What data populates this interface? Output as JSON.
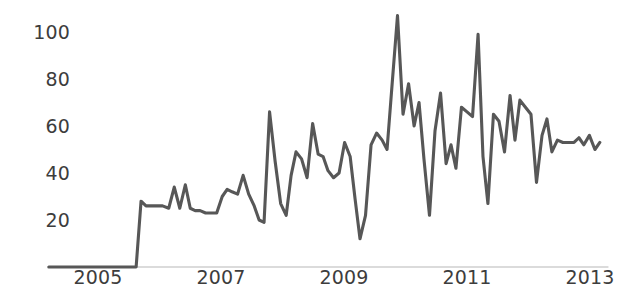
{
  "chart_data": {
    "type": "line",
    "title": "",
    "subtitle": "",
    "xlabel": "",
    "ylabel": "",
    "legend": [],
    "grid": false,
    "axis_color": "#555555",
    "line_color": "#575757",
    "background": "#ffffff",
    "xlim": [
      2004.2,
      2013.3
    ],
    "ylim": [
      0,
      112
    ],
    "y_ticks": [
      20,
      40,
      60,
      80,
      100
    ],
    "y_tick_labels": [
      "20",
      "40",
      "60",
      "80",
      "100"
    ],
    "x_ticks": [
      2005,
      2007,
      2009,
      2011,
      2013
    ],
    "x_tick_labels": [
      "2005",
      "2007",
      "2009",
      "2011",
      "2013"
    ],
    "series": [
      {
        "name": "series-1",
        "x": [
          2004.2,
          2004.35,
          2004.5,
          2004.65,
          2004.8,
          2004.95,
          2005.1,
          2005.25,
          2005.4,
          2005.55,
          2005.62,
          2005.7,
          2005.78,
          2005.86,
          2005.95,
          2006.05,
          2006.15,
          2006.24,
          2006.33,
          2006.42,
          2006.5,
          2006.58,
          2006.66,
          2006.75,
          2006.84,
          2006.93,
          2007.02,
          2007.1,
          2007.18,
          2007.27,
          2007.36,
          2007.45,
          2007.54,
          2007.62,
          2007.7,
          2007.79,
          2007.88,
          2007.97,
          2008.06,
          2008.14,
          2008.22,
          2008.31,
          2008.4,
          2008.49,
          2008.58,
          2008.66,
          2008.74,
          2008.83,
          2008.92,
          2009.01,
          2009.1,
          2009.18,
          2009.26,
          2009.35,
          2009.44,
          2009.53,
          2009.62,
          2009.7,
          2009.78,
          2009.87,
          2009.96,
          2010.05,
          2010.14,
          2010.22,
          2010.3,
          2010.39,
          2010.48,
          2010.57,
          2010.66,
          2010.74,
          2010.82,
          2010.91,
          2011.0,
          2011.09,
          2011.18,
          2011.26,
          2011.34,
          2011.43,
          2011.52,
          2011.61,
          2011.7,
          2011.78,
          2011.86,
          2011.95,
          2012.04,
          2012.13,
          2012.22,
          2012.3,
          2012.38,
          2012.47,
          2012.56,
          2012.65,
          2012.74,
          2012.82,
          2012.9,
          2012.99,
          2013.08,
          2013.16
        ],
        "y": [
          0,
          0,
          0,
          0,
          0,
          0,
          0,
          0,
          0,
          0,
          0,
          28,
          26,
          26,
          26,
          26,
          25,
          34,
          25,
          35,
          25,
          24,
          24,
          23,
          23,
          23,
          30,
          33,
          32,
          31,
          39,
          31,
          26,
          20,
          19,
          66,
          45,
          27,
          22,
          39,
          49,
          46,
          38,
          61,
          48,
          47,
          41,
          38,
          40,
          53,
          47,
          29,
          12,
          22,
          52,
          57,
          54,
          50,
          77,
          107,
          65,
          78,
          60,
          70,
          46,
          22,
          58,
          74,
          44,
          52,
          42,
          68,
          66,
          64,
          99,
          47,
          27,
          65,
          62,
          49,
          73,
          54,
          71,
          68,
          65,
          36,
          56,
          63,
          49,
          54,
          53,
          53,
          53,
          55,
          52,
          56,
          50,
          53
        ]
      }
    ]
  }
}
